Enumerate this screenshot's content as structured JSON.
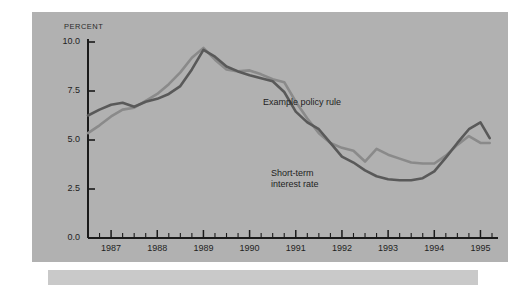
{
  "figure": {
    "background_color": "#ffffff",
    "panel_color": "#b1b1b1",
    "lower_bar_color": "#c9c9c9",
    "axis_color": "#1a1a1a"
  },
  "axis": {
    "unit_label": "PERCENT",
    "y_ticks": [
      "10.0",
      "7.5",
      "5.0",
      "2.5",
      "0.0"
    ],
    "x_ticks": [
      "1987",
      "1988",
      "1989",
      "1990",
      "1991",
      "1992",
      "1993",
      "1994",
      "1995"
    ]
  },
  "annotations": {
    "policy_rule": "Example policy rule",
    "short_rate": "Short-term\ninterest rate"
  },
  "chart_data": {
    "type": "line",
    "title": "",
    "subtitle": "",
    "xlabel": "",
    "ylabel": "PERCENT",
    "xlim": [
      1986.5,
      1995.25
    ],
    "ylim": [
      0.0,
      10.6
    ],
    "ytick_values": [
      10.0,
      7.5,
      5.0,
      2.5,
      0.0
    ],
    "xtick_values": [
      1987,
      1988,
      1989,
      1990,
      1991,
      1992,
      1993,
      1994,
      1995
    ],
    "x_minor_tick_interval": 0.25,
    "grid": false,
    "legend_position": "inline-annotations",
    "series": [
      {
        "name": "Example policy rule",
        "color": "#8a8a8a",
        "linewidth": 2.6,
        "x": [
          1986.5,
          1986.75,
          1987.0,
          1987.25,
          1987.5,
          1987.75,
          1988.0,
          1988.25,
          1988.5,
          1988.75,
          1989.0,
          1989.25,
          1989.5,
          1989.75,
          1990.0,
          1990.25,
          1990.5,
          1990.75,
          1991.0,
          1991.25,
          1991.5,
          1991.75,
          1992.0,
          1992.25,
          1992.5,
          1992.75,
          1993.0,
          1993.25,
          1993.5,
          1993.75,
          1994.0,
          1994.25,
          1994.5,
          1994.75,
          1995.0,
          1995.2
        ],
        "y": [
          5.35,
          5.75,
          6.2,
          6.55,
          6.65,
          7.0,
          7.35,
          7.85,
          8.45,
          9.2,
          9.7,
          9.1,
          8.6,
          8.5,
          8.55,
          8.35,
          8.1,
          7.95,
          6.95,
          6.1,
          5.35,
          4.85,
          4.6,
          4.45,
          3.9,
          4.55,
          4.25,
          4.05,
          3.85,
          3.8,
          3.8,
          4.2,
          4.75,
          5.2,
          4.85,
          4.85
        ]
      },
      {
        "name": "Short-term interest rate",
        "color": "#595959",
        "linewidth": 2.6,
        "x": [
          1986.5,
          1986.75,
          1987.0,
          1987.25,
          1987.5,
          1987.75,
          1988.0,
          1988.25,
          1988.5,
          1988.75,
          1989.0,
          1989.25,
          1989.5,
          1989.75,
          1990.0,
          1990.25,
          1990.5,
          1990.75,
          1991.0,
          1991.25,
          1991.5,
          1991.75,
          1992.0,
          1992.25,
          1992.5,
          1992.75,
          1993.0,
          1993.25,
          1993.5,
          1993.75,
          1994.0,
          1994.25,
          1994.5,
          1994.75,
          1995.0,
          1995.2
        ],
        "y": [
          6.25,
          6.55,
          6.8,
          6.9,
          6.7,
          6.95,
          7.1,
          7.35,
          7.75,
          8.6,
          9.6,
          9.25,
          8.75,
          8.5,
          8.3,
          8.15,
          8.0,
          7.45,
          6.45,
          5.9,
          5.55,
          4.85,
          4.15,
          3.85,
          3.45,
          3.15,
          3.0,
          2.95,
          2.95,
          3.05,
          3.4,
          4.1,
          4.85,
          5.55,
          5.9,
          5.1
        ]
      }
    ]
  }
}
